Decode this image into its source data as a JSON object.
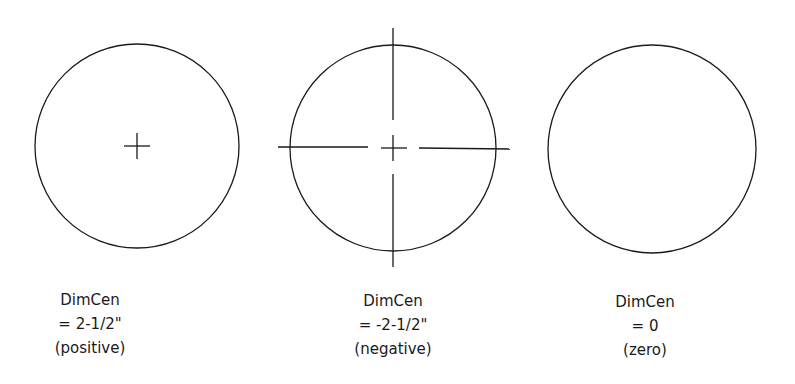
{
  "figure": {
    "stroke_color": "#1a1a1a",
    "panels": [
      {
        "name": "positive",
        "circle": {
          "cx": 137,
          "cy": 146,
          "r": 102
        },
        "center_mark": "small cross",
        "labels": [
          "DimCen",
          "= 2-1/2\"",
          "(positive)"
        ]
      },
      {
        "name": "negative",
        "circle": {
          "cx": 393,
          "cy": 148,
          "r": 103
        },
        "center_mark": "cross with extended center lines",
        "labels": [
          "DimCen",
          "= -2-1/2\"",
          "(negative)"
        ]
      },
      {
        "name": "zero",
        "circle": {
          "cx": 652,
          "cy": 149,
          "r": 104
        },
        "center_mark": "none",
        "labels": [
          "DimCen",
          "= 0",
          "(zero)"
        ]
      }
    ]
  }
}
